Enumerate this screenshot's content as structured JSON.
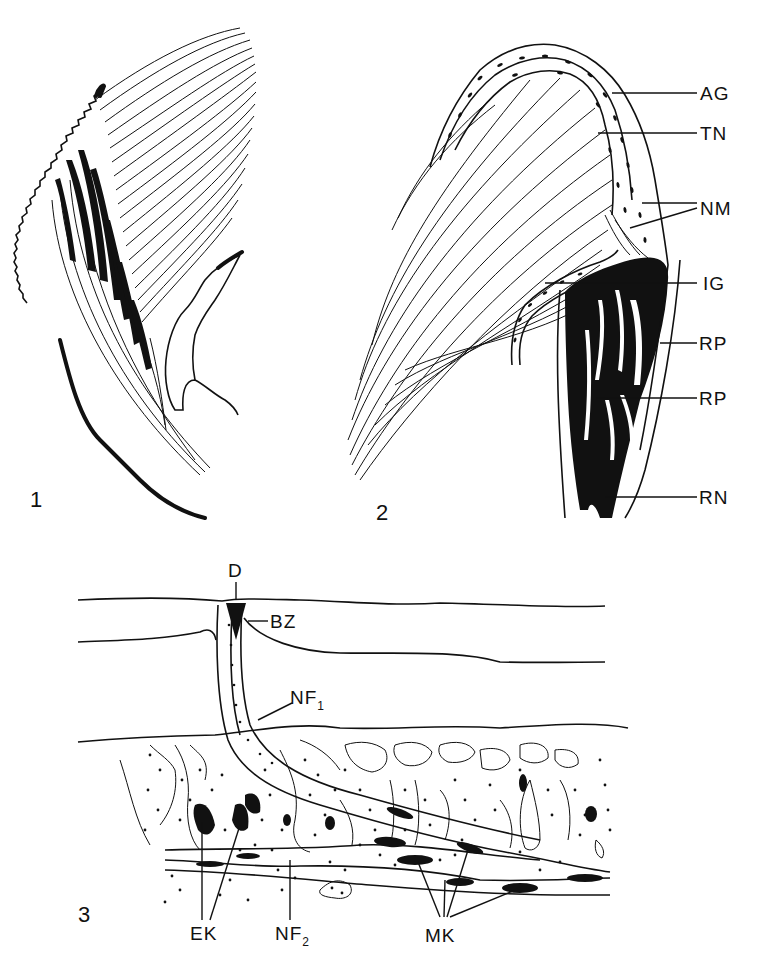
{
  "figure": {
    "panels": [
      {
        "number": "1",
        "labels": []
      },
      {
        "number": "2",
        "labels": [
          {
            "text": "AG"
          },
          {
            "text": "TN"
          },
          {
            "text": "NM"
          },
          {
            "text": "IG"
          },
          {
            "text": "RP"
          },
          {
            "text": "RP"
          },
          {
            "text": "RN"
          }
        ]
      },
      {
        "number": "3",
        "labels": [
          {
            "text": "D"
          },
          {
            "text": "BZ"
          },
          {
            "text": "NF",
            "subscript": "1"
          },
          {
            "text": "EK"
          },
          {
            "text": "NF",
            "subscript": "2"
          },
          {
            "text": "MK"
          }
        ]
      }
    ]
  },
  "colors": {
    "ink": "#111111",
    "paper": "#ffffff"
  }
}
